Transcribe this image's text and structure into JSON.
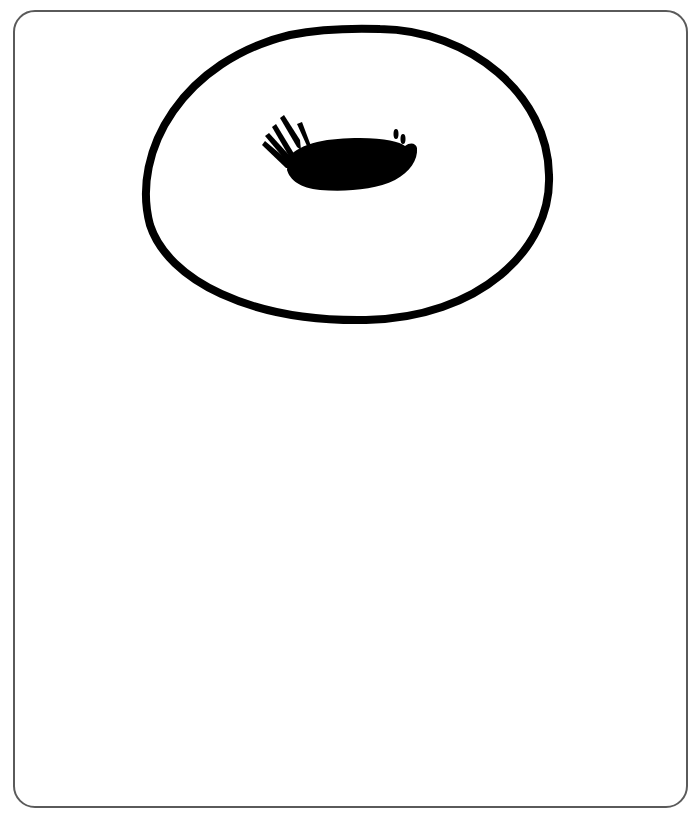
{
  "figure": {
    "frame_color": "#5a5a5a",
    "ink_color": "#000000",
    "background_color": "#ffffff",
    "elements": [
      {
        "name": "oval-ring",
        "shape": "ellipse",
        "cx": 346,
        "cy": 174,
        "rx": 204,
        "ry": 147,
        "stroke_width": 8
      },
      {
        "name": "creature-body",
        "shape": "blob",
        "bbox": [
          262,
          118,
          418,
          192
        ]
      },
      {
        "name": "creature-legs",
        "count": 4
      },
      {
        "name": "creature-marks",
        "count": 2
      }
    ]
  }
}
